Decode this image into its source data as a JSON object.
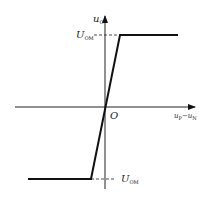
{
  "diagram": {
    "type": "voltage-transfer-characteristic",
    "y_axis_label": {
      "main": "u",
      "sub": "O"
    },
    "x_axis_label": {
      "main1": "u",
      "sub1": "P",
      "sep": "−",
      "main2": "u",
      "sub2": "N"
    },
    "origin_label": "O",
    "upper_level_label": {
      "main": "U",
      "sub": "OM"
    },
    "lower_level_label": {
      "main": "U",
      "sub": "OM"
    }
  }
}
